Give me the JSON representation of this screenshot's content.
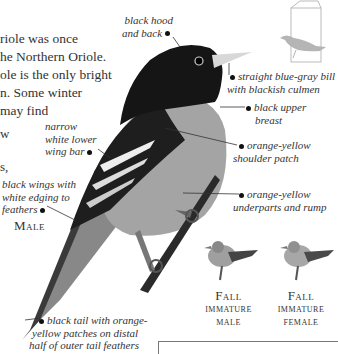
{
  "intro_text": {
    "lines": [
      "riole was once",
      "he Northern Oriole.",
      "ole is the only bright",
      "n. Some winter",
      "may find"
    ],
    "fragments": [
      "w",
      "s,"
    ]
  },
  "annotations": {
    "black_hood": [
      "black hood",
      "and back"
    ],
    "bill": [
      "straight blue-gray bill",
      "with blackish culmen"
    ],
    "upper_breast": [
      "black upper",
      "breast"
    ],
    "shoulder": [
      "orange-yellow",
      "shoulder patch"
    ],
    "underparts": [
      "orange-yellow",
      "underparts and rump"
    ],
    "wing_bar": [
      "narrow",
      "white lower",
      "wing bar"
    ],
    "wings": [
      "black wings with",
      "white edging to",
      "feathers"
    ],
    "tail": [
      "black tail with orange-",
      "yellow patches on distal",
      "half of outer tail feathers"
    ]
  },
  "figure_labels": {
    "male": "Male",
    "fall_immature_male": [
      "Fall",
      "immature",
      "male"
    ],
    "fall_immature_female": [
      "Fall",
      "immature",
      "female"
    ]
  },
  "icons": {
    "habitat_icon": "bird-in-book-icon"
  },
  "colors": {
    "text": "#333333",
    "bird_black": "#151515",
    "bird_gray": "#9a9a9a",
    "range_icon_gray": "#b5b5b5"
  }
}
